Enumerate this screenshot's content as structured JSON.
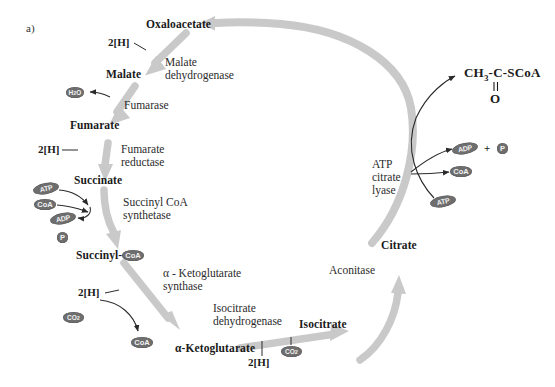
{
  "figure": {
    "panel_label": "a)",
    "type": "reductive-tca-cycle-diagram",
    "colors": {
      "background": "#ffffff",
      "cycle_arrow": "#c9c9c9",
      "badge_fill": "#6e6e6e",
      "text": "#1a1a1a"
    }
  },
  "metabolites": [
    {
      "id": "oxaloacetate",
      "label": "Oxaloacetate"
    },
    {
      "id": "malate",
      "label": "Malate"
    },
    {
      "id": "fumarate",
      "label": "Fumarate"
    },
    {
      "id": "succinate",
      "label": "Succinate"
    },
    {
      "id": "succinyl_coa",
      "label": "Succinyl-",
      "badge": "CoA"
    },
    {
      "id": "alpha_ketoglutarate",
      "label": "α-Ketoglutarate"
    },
    {
      "id": "isocitrate",
      "label": "Isocitrate"
    },
    {
      "id": "citrate",
      "label": "Citrate"
    }
  ],
  "enzymes": [
    {
      "id": "malate_dehydrogenase",
      "line1": "Malate",
      "line2": "dehydrogenase"
    },
    {
      "id": "fumarase",
      "line1": "Fumarase",
      "line2": ""
    },
    {
      "id": "fumarate_reductase",
      "line1": "Fumarate",
      "line2": "reductase"
    },
    {
      "id": "succinyl_coa_synthetase",
      "line1": "Succinyl CoA",
      "line2": "synthetase"
    },
    {
      "id": "alpha_ketoglutarate_synthase",
      "line1": "α - Ketoglutarate",
      "line2": "synthase"
    },
    {
      "id": "isocitrate_dehydrogenase",
      "line1": "Isocitrate",
      "line2": "dehydrogenase"
    },
    {
      "id": "aconitase",
      "line1": "Aconitase",
      "line2": ""
    },
    {
      "id": "atp_citrate_lyase",
      "line1": "ATP",
      "line2": "citrate",
      "line3": "lyase"
    }
  ],
  "cofactors": {
    "reducing_equivalents_label": "2[H]",
    "water": "H₂O",
    "carbon_dioxide": "CO₂",
    "atp": "ATP",
    "adp": "ADP",
    "coa": "CoA",
    "phosphate": "P",
    "plus_sign": "+"
  },
  "reducing_equivalent_steps": [
    {
      "id": "oxaloacetate-to-malate",
      "label": "2[H]"
    },
    {
      "id": "fumarate-to-succinate",
      "label": "2[H]"
    },
    {
      "id": "succinyl-coa-to-akg",
      "label": "2[H]"
    },
    {
      "id": "akg-to-isocitrate",
      "label": "2[H]"
    }
  ],
  "co2_steps": [
    {
      "id": "succinyl-coa-to-akg-co2",
      "label": "CO₂"
    },
    {
      "id": "akg-to-isocitrate-co2",
      "label": "CO₂"
    }
  ],
  "succinyl_coa_synthetase_cofactors": {
    "input_atp": "ATP",
    "input_coa": "CoA",
    "output_adp": "ADP",
    "output_phosphate": "P"
  },
  "atp_citrate_lyase_reaction": {
    "input_atp": "ATP",
    "output_adp": "ADP",
    "output_phosphate": "P",
    "output_coa": "CoA",
    "plus": "+",
    "product_formula": "CH₃-C-SCoA",
    "product_carbonyl": "O",
    "product_bond": "‖"
  }
}
